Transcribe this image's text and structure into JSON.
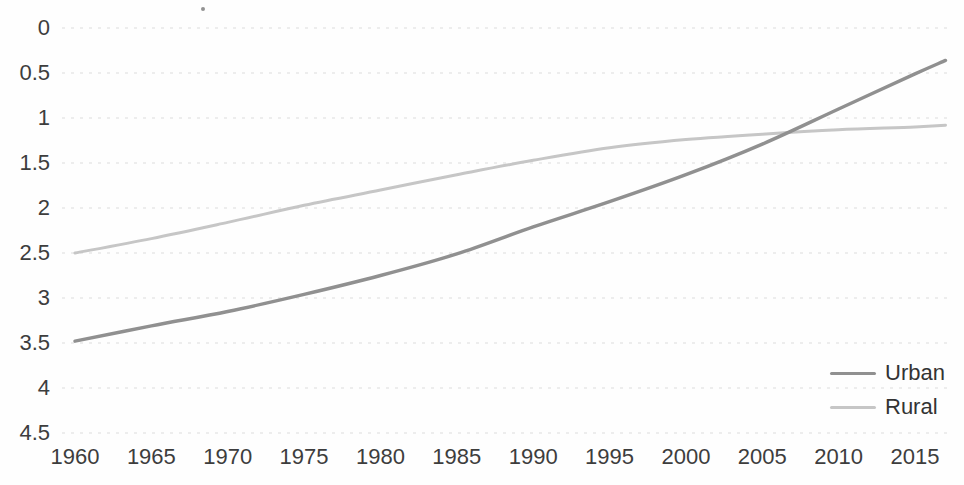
{
  "chart_data": {
    "type": "line",
    "title": "",
    "xlabel": "",
    "ylabel": "",
    "xlim": [
      1960,
      2017
    ],
    "ylim": [
      0,
      4.5
    ],
    "grid": "horizontal-dotted-faint",
    "legend_position": "bottom-right",
    "x_ticks": [
      1960,
      1965,
      1970,
      1975,
      1980,
      1985,
      1990,
      1995,
      2000,
      2005,
      2010,
      2015
    ],
    "x_tick_labels": [
      "1960",
      "1965",
      "1970",
      "1975",
      "1980",
      "1985",
      "1990",
      "1995",
      "2000",
      "2005",
      "2010",
      "2015"
    ],
    "y_ticks": [
      0,
      0.5,
      1,
      1.5,
      2,
      2.5,
      3,
      3.5,
      4,
      4.5
    ],
    "y_tick_labels": [
      "0",
      "0.5",
      "1",
      "1.5",
      "2",
      "2.5",
      "3",
      "3.5",
      "4",
      "4.5"
    ],
    "x": [
      1960,
      1965,
      1970,
      1975,
      1980,
      1985,
      1990,
      1995,
      2000,
      2005,
      2010,
      2015,
      2017
    ],
    "series": [
      {
        "name": "Urban",
        "color": "#909090",
        "stroke_width": 3.4,
        "values": [
          1.02,
          1.19,
          1.35,
          1.54,
          1.75,
          1.99,
          2.29,
          2.57,
          2.87,
          3.21,
          3.6,
          3.99,
          4.14
        ]
      },
      {
        "name": "Rural",
        "color": "#c6c6c6",
        "stroke_width": 3.0,
        "values": [
          2.0,
          2.16,
          2.34,
          2.53,
          2.7,
          2.87,
          3.03,
          3.17,
          3.26,
          3.32,
          3.37,
          3.4,
          3.42
        ]
      }
    ],
    "colors": {
      "grid": "#e7e7e7",
      "tick_text": "#3d3d3d",
      "legend_text": "#333333",
      "background": "#fefefe"
    }
  }
}
